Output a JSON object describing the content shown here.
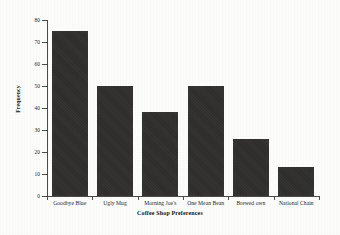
{
  "chart_data": {
    "type": "bar",
    "title": "",
    "subtitle": "",
    "xlabel": "Coffee Shop Preferences",
    "ylabel": "Frequency",
    "categories": [
      "Goodbye Blue",
      "Ugly Mug",
      "Morning Joe's",
      "One Mean Bean",
      "Brewed own",
      "National Chain"
    ],
    "values": [
      75,
      50,
      38,
      50,
      26,
      13
    ],
    "ylim": [
      0,
      80
    ],
    "yticks": [
      0,
      10,
      20,
      30,
      40,
      50,
      60,
      70,
      80
    ],
    "ytick_labels": [
      "0",
      "10",
      "20",
      "30",
      "40",
      "50",
      "60",
      "70",
      "80"
    ],
    "grid": false,
    "legend": false,
    "legend_position": "none",
    "bar_color": "#2e2d2c",
    "axis_color": "#4a4a4a",
    "background_color": "#fdfdfc",
    "annotations": []
  },
  "figure": {
    "background_color": "#fdfdfc"
  }
}
